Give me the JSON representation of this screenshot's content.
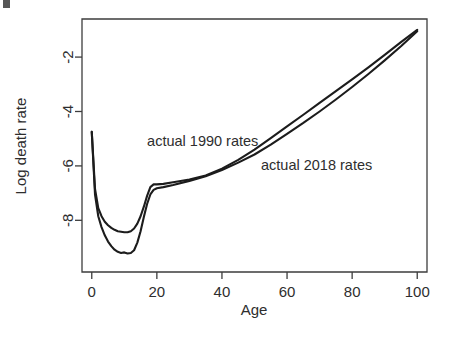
{
  "figure": {
    "background_color": "#ffffff",
    "line_color": "#1c1c1c",
    "axis_color": "#3d3d3d"
  },
  "chart_data": {
    "type": "line",
    "title": "",
    "subtitle": "",
    "xlabel": "Age",
    "ylabel": "Log death rate",
    "xlim": [
      -3,
      103
    ],
    "ylim": [
      -9.9,
      -0.6
    ],
    "xticks": [
      0,
      20,
      40,
      60,
      80,
      100
    ],
    "xticklabels": [
      "0",
      "20",
      "40",
      "60",
      "80",
      "100"
    ],
    "yticks": [
      -2,
      -4,
      -6,
      -8
    ],
    "yticklabels": [
      "-2",
      "-4",
      "-6",
      "-8"
    ],
    "grid": false,
    "legend": "none",
    "annotations": [
      {
        "text": "actual 1990 rates",
        "x": 17,
        "y": -5.25
      },
      {
        "text": "actual 2018 rates",
        "x": 52,
        "y": -6.15
      }
    ],
    "x": [
      0,
      1,
      2,
      3,
      4,
      5,
      6,
      7,
      8,
      9,
      10,
      11,
      12,
      13,
      14,
      15,
      16,
      17,
      18,
      19,
      20,
      22,
      25,
      30,
      35,
      40,
      45,
      50,
      55,
      60,
      65,
      70,
      75,
      80,
      85,
      90,
      95,
      100
    ],
    "series": [
      {
        "name": "actual 1990 rates",
        "values": [
          -4.75,
          -6.85,
          -7.55,
          -7.85,
          -8.05,
          -8.18,
          -8.28,
          -8.35,
          -8.4,
          -8.42,
          -8.44,
          -8.44,
          -8.4,
          -8.3,
          -8.12,
          -7.85,
          -7.5,
          -7.1,
          -6.78,
          -6.68,
          -6.68,
          -6.66,
          -6.6,
          -6.5,
          -6.35,
          -6.1,
          -5.78,
          -5.4,
          -4.98,
          -4.55,
          -4.12,
          -3.68,
          -3.25,
          -2.82,
          -2.38,
          -1.92,
          -1.45,
          -1.0
        ]
      },
      {
        "name": "actual 2018 rates",
        "values": [
          -4.75,
          -7.05,
          -7.85,
          -8.25,
          -8.55,
          -8.78,
          -8.95,
          -9.08,
          -9.16,
          -9.2,
          -9.18,
          -9.22,
          -9.2,
          -9.1,
          -8.82,
          -8.4,
          -7.88,
          -7.4,
          -7.05,
          -6.88,
          -6.82,
          -6.78,
          -6.7,
          -6.55,
          -6.38,
          -6.15,
          -5.88,
          -5.58,
          -5.22,
          -4.82,
          -4.42,
          -4.0,
          -3.56,
          -3.1,
          -2.62,
          -2.12,
          -1.6,
          -1.05
        ]
      }
    ]
  }
}
